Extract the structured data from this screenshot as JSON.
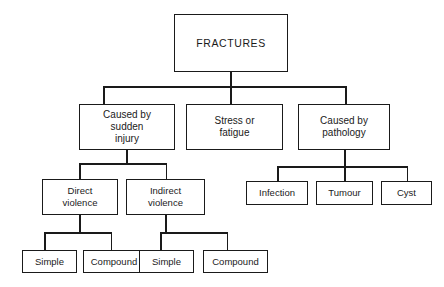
{
  "diagram": {
    "type": "tree-hierarchy",
    "line_color": "#1a1a1a",
    "background_color": "#ffffff",
    "nodes": {
      "root": {
        "label": "FRACTURES"
      },
      "level2": [
        {
          "id": "sudden-injury",
          "label": "Caused by\nsudden\ninjury"
        },
        {
          "id": "stress-fatigue",
          "label": "Stress or\nfatigue"
        },
        {
          "id": "pathology",
          "label": "Caused by\npathology"
        }
      ],
      "level3_injury": [
        {
          "id": "direct-violence",
          "label": "Direct\nviolence"
        },
        {
          "id": "indirect-violence",
          "label": "Indirect\nviolence"
        }
      ],
      "level3_pathology": [
        {
          "id": "infection",
          "label": "Infection"
        },
        {
          "id": "tumour",
          "label": "Tumour"
        },
        {
          "id": "cyst",
          "label": "Cyst"
        }
      ],
      "level4_direct": [
        {
          "id": "direct-simple",
          "label": "Simple"
        },
        {
          "id": "direct-compound",
          "label": "Compound"
        }
      ],
      "level4_indirect": [
        {
          "id": "indirect-simple",
          "label": "Simple"
        },
        {
          "id": "indirect-compound",
          "label": "Compound"
        }
      ]
    }
  }
}
